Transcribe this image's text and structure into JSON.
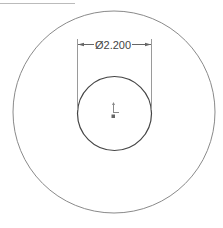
{
  "view": {
    "header_text_cut": "",
    "dimension": {
      "symbol": "Ø",
      "value": "2.200",
      "label": "Ø2.200"
    },
    "features": [
      {
        "name": "outer-circle",
        "type": "circle"
      },
      {
        "name": "inner-circle",
        "type": "circle",
        "diameter": "2.200"
      }
    ],
    "colors": {
      "line": "#7a7a7a",
      "inner_line": "#444444",
      "dim_line": "#666666"
    }
  }
}
